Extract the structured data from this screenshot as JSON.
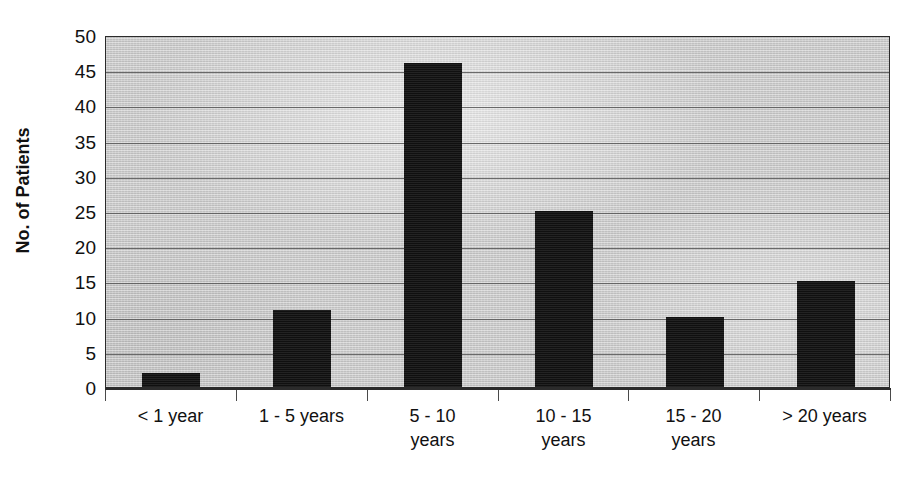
{
  "chart_data": {
    "type": "bar",
    "title": "",
    "subtitle": "",
    "xlabel": "",
    "ylabel": "No. of Patients",
    "categories": [
      "< 1 year",
      "1 - 5 years",
      "5 - 10 years",
      "10 - 15 years",
      "15 - 20 years",
      "> 20 years"
    ],
    "category_lines": [
      [
        "< 1 year"
      ],
      [
        "1 - 5 years"
      ],
      [
        "5 - 10",
        "years"
      ],
      [
        "10 - 15",
        "years"
      ],
      [
        "15 - 20",
        "years"
      ],
      [
        "> 20 years"
      ]
    ],
    "values": [
      2,
      11,
      46,
      25,
      10,
      15
    ],
    "ylim": [
      0,
      50
    ],
    "ytick_step": 5,
    "yticks": [
      0,
      5,
      10,
      15,
      20,
      25,
      30,
      35,
      40,
      45,
      50
    ],
    "ytick_labels": [
      "0",
      "5",
      "10",
      "15",
      "20",
      "25",
      "30",
      "35",
      "40",
      "45",
      "50"
    ],
    "grid": "horizontal",
    "legend": "none",
    "bar_color": "#171717",
    "plot_background_color": "#c9c9c9",
    "gridline_color": "#555555",
    "axis_color": "#2b2b2b",
    "text_color": "#111111"
  }
}
